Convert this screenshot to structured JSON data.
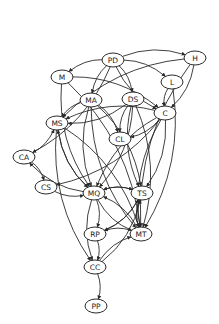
{
  "diagram": {
    "type": "directed-graph",
    "nodes": [
      {
        "id": "PD",
        "label": "PD",
        "x": 113,
        "y": 60
      },
      {
        "id": "H",
        "label": "H",
        "x": 195,
        "y": 58
      },
      {
        "id": "M",
        "label": "M",
        "x": 62,
        "y": 77
      },
      {
        "id": "L",
        "label": "L",
        "x": 172,
        "y": 82
      },
      {
        "id": "MA",
        "label": "MA",
        "x": 91,
        "y": 100
      },
      {
        "id": "DS",
        "label": "DS",
        "x": 133,
        "y": 99
      },
      {
        "id": "C",
        "label": "C",
        "x": 165,
        "y": 113
      },
      {
        "id": "MS",
        "label": "MS",
        "x": 57,
        "y": 123
      },
      {
        "id": "CL",
        "label": "CL",
        "x": 120,
        "y": 139
      },
      {
        "id": "CA",
        "label": "CA",
        "x": 24,
        "y": 157
      },
      {
        "id": "CS",
        "label": "CS",
        "x": 46,
        "y": 187
      },
      {
        "id": "MQ",
        "label": "MQ",
        "x": 94,
        "y": 193
      },
      {
        "id": "TS",
        "label": "TS",
        "x": 142,
        "y": 193
      },
      {
        "id": "RP",
        "label": "RP",
        "x": 95,
        "y": 234
      },
      {
        "id": "MT",
        "label": "MT",
        "x": 141,
        "y": 234
      },
      {
        "id": "CC",
        "label": "CC",
        "x": 95,
        "y": 267
      },
      {
        "id": "PP",
        "label": "PP",
        "x": 96,
        "y": 306
      }
    ],
    "edges": [
      {
        "from": "PD",
        "to": "H"
      },
      {
        "from": "PD",
        "to": "M"
      },
      {
        "from": "PD",
        "to": "L"
      },
      {
        "from": "PD",
        "to": "MA"
      },
      {
        "from": "PD",
        "to": "DS"
      },
      {
        "from": "PD",
        "to": "C"
      },
      {
        "from": "PD",
        "to": "CA"
      },
      {
        "from": "H",
        "to": "MS"
      },
      {
        "from": "H",
        "to": "C"
      },
      {
        "from": "H",
        "to": "MT"
      },
      {
        "from": "M",
        "to": "C"
      },
      {
        "from": "M",
        "to": "MQ"
      },
      {
        "from": "M",
        "to": "MT"
      },
      {
        "from": "L",
        "to": "C"
      },
      {
        "from": "L",
        "to": "MT"
      },
      {
        "from": "MA",
        "to": "MS"
      },
      {
        "from": "MA",
        "to": "CL"
      },
      {
        "from": "MA",
        "to": "MQ"
      },
      {
        "from": "MA",
        "to": "TS"
      },
      {
        "from": "MA",
        "to": "MT"
      },
      {
        "from": "DS",
        "to": "MS"
      },
      {
        "from": "DS",
        "to": "CL"
      },
      {
        "from": "DS",
        "to": "MQ"
      },
      {
        "from": "DS",
        "to": "TS"
      },
      {
        "from": "DS",
        "to": "MT"
      },
      {
        "from": "C",
        "to": "MS"
      },
      {
        "from": "C",
        "to": "CL"
      },
      {
        "from": "C",
        "to": "MQ"
      },
      {
        "from": "C",
        "to": "TS"
      },
      {
        "from": "C",
        "to": "MT"
      },
      {
        "from": "C",
        "to": "CS"
      },
      {
        "from": "MS",
        "to": "MQ"
      },
      {
        "from": "MS",
        "to": "MT"
      },
      {
        "from": "MS",
        "to": "CC"
      },
      {
        "from": "CA",
        "to": "CS"
      },
      {
        "from": "CA",
        "to": "MS"
      },
      {
        "from": "MQ",
        "to": "CA"
      },
      {
        "from": "CS",
        "to": "MQ"
      },
      {
        "from": "MQ",
        "to": "TS"
      },
      {
        "from": "TS",
        "to": "MQ"
      },
      {
        "from": "MQ",
        "to": "RP"
      },
      {
        "from": "MQ",
        "to": "MT"
      },
      {
        "from": "MQ",
        "to": "MS"
      },
      {
        "from": "MT",
        "to": "MQ"
      },
      {
        "from": "MT",
        "to": "TS"
      },
      {
        "from": "TS",
        "to": "MT"
      },
      {
        "from": "TS",
        "to": "RP"
      },
      {
        "from": "MT",
        "to": "RP"
      },
      {
        "from": "RP",
        "to": "CC"
      },
      {
        "from": "RP",
        "to": "TS"
      },
      {
        "from": "CC",
        "to": "MT"
      },
      {
        "from": "CC",
        "to": "TS"
      },
      {
        "from": "CC",
        "to": "PP"
      },
      {
        "from": "MQ",
        "to": "CC"
      }
    ]
  }
}
